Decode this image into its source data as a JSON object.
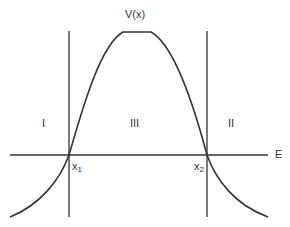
{
  "diagram": {
    "title": "V(x)",
    "axis_label": "E",
    "regions": [
      "I",
      "III",
      "II"
    ],
    "turning_points": [
      {
        "base": "x",
        "sub": "1"
      },
      {
        "base": "x",
        "sub": "2"
      }
    ]
  }
}
